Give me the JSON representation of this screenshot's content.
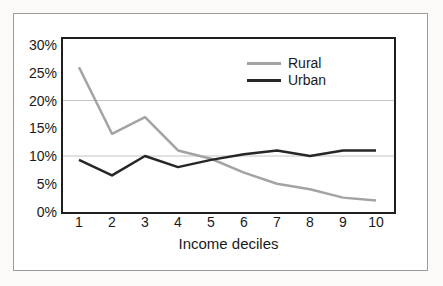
{
  "figure": {
    "background": "#ffffff",
    "frame_border_color": "#9b9b9b"
  },
  "chart_data": {
    "type": "line",
    "title": "",
    "xlabel": "Income deciles",
    "ylabel": "",
    "categories": [
      "1",
      "2",
      "3",
      "4",
      "5",
      "6",
      "7",
      "8",
      "9",
      "10"
    ],
    "series": [
      {
        "name": "Rural",
        "color": "#a3a3a3",
        "values": [
          26,
          14,
          17,
          11,
          9.5,
          7,
          5,
          4,
          2.5,
          2
        ]
      },
      {
        "name": "Urban",
        "color": "#262626",
        "values": [
          9.3,
          6.5,
          10,
          8,
          9.3,
          10.3,
          11,
          10,
          11,
          11
        ]
      }
    ],
    "y_ticks": [
      {
        "value": 0,
        "label": "0%"
      },
      {
        "value": 5,
        "label": "5%"
      },
      {
        "value": 10,
        "label": "10%"
      },
      {
        "value": 15,
        "label": "15%"
      },
      {
        "value": 20,
        "label": "20%"
      },
      {
        "value": 25,
        "label": "25%"
      },
      {
        "value": 30,
        "label": "30%"
      }
    ],
    "gridline_values": [
      10,
      20
    ],
    "ylim": [
      0,
      31
    ],
    "grid_color": "#c4c4c4",
    "axis_color": "#1f1f1f",
    "legend_position": "top-right",
    "grid": "horizontal-only"
  }
}
